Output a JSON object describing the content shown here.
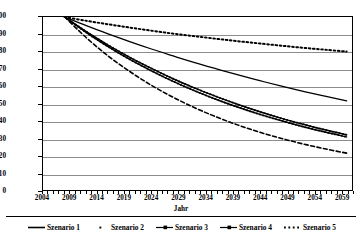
{
  "chart_data": {
    "type": "line",
    "title": "",
    "xlabel": "Jahr",
    "ylabel": "Leistungsniveau in Prozent (Index 2007=100)",
    "xlim": [
      2004,
      2061
    ],
    "ylim": [
      0,
      100
    ],
    "grid": true,
    "legend_position": "bottom",
    "xticks": [
      2004,
      2009,
      2014,
      2019,
      2024,
      2029,
      2034,
      2039,
      2044,
      2049,
      2054,
      2059
    ],
    "yticks": [
      0,
      10,
      20,
      30,
      40,
      50,
      60,
      70,
      80,
      90,
      100
    ],
    "x": [
      2008,
      2012,
      2016,
      2020,
      2024,
      2028,
      2032,
      2036,
      2040,
      2044,
      2048,
      2052,
      2056,
      2060
    ],
    "series": [
      {
        "name": "Szenario 1",
        "style": "solid",
        "values": [
          100,
          95.0,
          90.3,
          85.8,
          81.5,
          77.5,
          73.6,
          70.0,
          66.5,
          63.2,
          60.0,
          57.0,
          54.2,
          51.5
        ]
      },
      {
        "name": "Szenario 2",
        "style": "dotted-fine",
        "values": [
          100,
          97.8,
          95.8,
          93.9,
          92.1,
          90.4,
          88.9,
          87.4,
          86.0,
          84.7,
          83.4,
          82.2,
          81.1,
          80.0
        ]
      },
      {
        "name": "Szenario 3",
        "style": "solid-marker",
        "values": [
          100,
          91.5,
          83.8,
          76.7,
          70.3,
          64.3,
          58.9,
          54.0,
          49.4,
          45.2,
          41.4,
          38.0,
          34.8,
          31.9
        ]
      },
      {
        "name": "Szenario 4",
        "style": "solid-marker",
        "values": [
          100,
          91.0,
          82.9,
          75.5,
          68.9,
          62.8,
          57.3,
          52.3,
          47.8,
          43.7,
          40.0,
          36.6,
          33.5,
          30.7
        ]
      },
      {
        "name": "Szenario 5",
        "style": "dashed",
        "values": [
          100,
          88.0,
          77.5,
          68.5,
          60.5,
          53.6,
          47.5,
          42.2,
          37.5,
          33.4,
          29.8,
          26.6,
          23.8,
          21.3
        ]
      }
    ]
  },
  "legend": {
    "items": [
      {
        "label": "Szenario 1",
        "marker": "solid-line"
      },
      {
        "label": "Szenario 2",
        "marker": "dot"
      },
      {
        "label": "Szenario 3",
        "marker": "line-with-marker"
      },
      {
        "label": "Szenario 4",
        "marker": "line-with-marker"
      },
      {
        "label": "Szenario 5",
        "marker": "dotted-line"
      }
    ]
  },
  "colors": {
    "line": "#000000",
    "grid": "#8c8c8c",
    "background": "#ffffff"
  }
}
